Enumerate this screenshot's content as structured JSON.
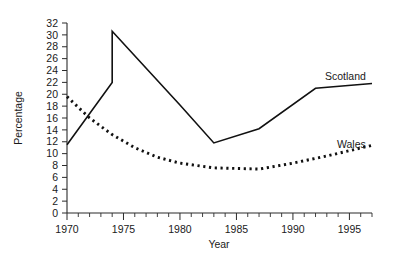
{
  "chart_data": {
    "type": "line",
    "title": "",
    "xlabel": "Year",
    "ylabel": "Percentage",
    "xlim": [
      1970,
      1997
    ],
    "ylim": [
      0,
      32
    ],
    "grid": false,
    "legend_position": "inline-right",
    "x_ticks_major": [
      1970,
      1975,
      1980,
      1985,
      1990,
      1995
    ],
    "x_tick_labels": [
      "1970",
      "1975",
      "1980",
      "1985",
      "1990",
      "1995"
    ],
    "x_ticks_minor_step": 1,
    "y_ticks": [
      0,
      2,
      4,
      6,
      8,
      10,
      12,
      14,
      16,
      18,
      20,
      22,
      24,
      26,
      28,
      30,
      32
    ],
    "y_tick_labels": [
      "0",
      "2",
      "4",
      "6",
      "8",
      "10",
      "12",
      "14",
      "16",
      "18",
      "20",
      "22",
      "24",
      "26",
      "28",
      "30",
      "32"
    ],
    "series": [
      {
        "name": "Scotland",
        "style": "solid",
        "label": "Scotland",
        "points": [
          [
            1970,
            11.5
          ],
          [
            1974,
            22.0
          ],
          [
            1974,
            30.6
          ],
          [
            1980,
            18.2
          ],
          [
            1983,
            11.8
          ],
          [
            1987,
            14.2
          ],
          [
            1992,
            21.0
          ],
          [
            1997,
            21.8
          ]
        ]
      },
      {
        "name": "Wales",
        "style": "dotted",
        "label": "Wales",
        "points": [
          [
            1970,
            19.6
          ],
          [
            1972,
            16.0
          ],
          [
            1974,
            13.2
          ],
          [
            1976,
            11.0
          ],
          [
            1978,
            9.4
          ],
          [
            1980,
            8.4
          ],
          [
            1983,
            7.6
          ],
          [
            1987,
            7.4
          ],
          [
            1990,
            8.4
          ],
          [
            1993,
            9.6
          ],
          [
            1997,
            11.4
          ]
        ]
      }
    ]
  },
  "labels": {
    "scotland": "Scotland",
    "wales": "Wales",
    "x_axis_title": "Year",
    "y_axis_title": "Percentage"
  }
}
